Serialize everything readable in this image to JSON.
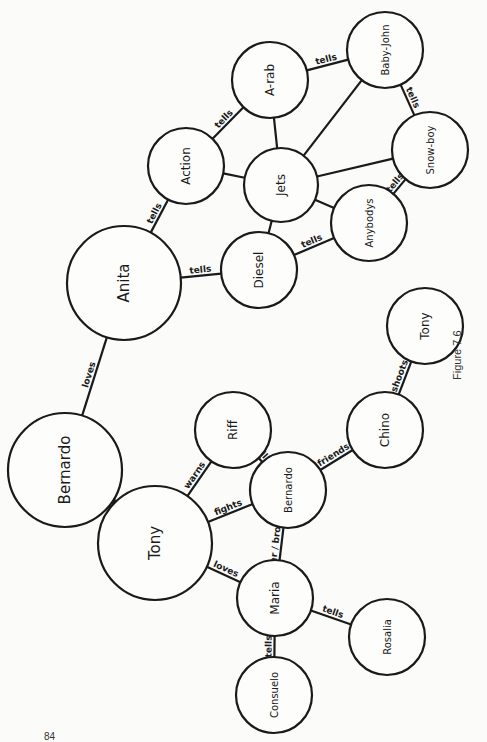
{
  "figure": {
    "caption": "Figure 7.6",
    "page_number": "84"
  },
  "nodes": [
    {
      "id": "baby-john",
      "label": "Baby-John",
      "x": 385,
      "y": 50,
      "r": 38
    },
    {
      "id": "a-rab",
      "label": "A-rab",
      "x": 270,
      "y": 80,
      "r": 38
    },
    {
      "id": "action",
      "label": "Action",
      "x": 186,
      "y": 166,
      "r": 38
    },
    {
      "id": "jets",
      "label": "Jets",
      "x": 281,
      "y": 185,
      "r": 37
    },
    {
      "id": "snow-boy",
      "label": "Snow-boy",
      "x": 430,
      "y": 150,
      "r": 38
    },
    {
      "id": "anybodys",
      "label": "Anybodys",
      "x": 369,
      "y": 223,
      "r": 38
    },
    {
      "id": "diesel",
      "label": "Diesel",
      "x": 259,
      "y": 270,
      "r": 38
    },
    {
      "id": "anita",
      "label": "Anita",
      "x": 124,
      "y": 283,
      "r": 57
    },
    {
      "id": "bernardo-1",
      "label": "Bernardo",
      "x": 65,
      "y": 470,
      "r": 57
    },
    {
      "id": "riff",
      "label": "Riff",
      "x": 233,
      "y": 430,
      "r": 38
    },
    {
      "id": "tony-1",
      "label": "Tony",
      "x": 155,
      "y": 543,
      "r": 57
    },
    {
      "id": "bernardo-2",
      "label": "Bernardo",
      "x": 288,
      "y": 490,
      "r": 38
    },
    {
      "id": "chino",
      "label": "Chino",
      "x": 385,
      "y": 430,
      "r": 38
    },
    {
      "id": "tony-2",
      "label": "Tony",
      "x": 425,
      "y": 326,
      "r": 38
    },
    {
      "id": "maria",
      "label": "Maria",
      "x": 275,
      "y": 598,
      "r": 38
    },
    {
      "id": "consuelo",
      "label": "Consuelo",
      "x": 274,
      "y": 695,
      "r": 38
    },
    {
      "id": "rosalia",
      "label": "Rosalia",
      "x": 387,
      "y": 637,
      "r": 38
    }
  ],
  "edges": [
    {
      "from": "a-rab",
      "to": "baby-john",
      "label": "tells"
    },
    {
      "from": "action",
      "to": "a-rab",
      "label": "tells"
    },
    {
      "from": "baby-john",
      "to": "snow-boy",
      "label": "tells"
    },
    {
      "from": "jets",
      "to": "a-rab",
      "label": ""
    },
    {
      "from": "jets",
      "to": "baby-john",
      "label": ""
    },
    {
      "from": "jets",
      "to": "snow-boy",
      "label": ""
    },
    {
      "from": "jets",
      "to": "action",
      "label": ""
    },
    {
      "from": "jets",
      "to": "anybodys",
      "label": ""
    },
    {
      "from": "jets",
      "to": "diesel",
      "label": ""
    },
    {
      "from": "anybodys",
      "to": "snow-boy",
      "label": "tells"
    },
    {
      "from": "diesel",
      "to": "anybodys",
      "label": "tells"
    },
    {
      "from": "anita",
      "to": "action",
      "label": "tells"
    },
    {
      "from": "anita",
      "to": "diesel",
      "label": "tells"
    },
    {
      "from": "bernardo-1",
      "to": "anita",
      "label": "loves"
    },
    {
      "from": "tony-1",
      "to": "bernardo-1",
      "label": "hates"
    },
    {
      "from": "tony-1",
      "to": "riff",
      "label": "warns"
    },
    {
      "from": "tony-1",
      "to": "bernardo-2",
      "label": "fights"
    },
    {
      "from": "bernardo-2",
      "to": "riff",
      "label": "kills"
    },
    {
      "from": "bernardo-2",
      "to": "chino",
      "label": "friends"
    },
    {
      "from": "chino",
      "to": "tony-2",
      "label": "shoots"
    },
    {
      "from": "maria",
      "to": "bernardo-2",
      "label": "sister / brother"
    },
    {
      "from": "maria",
      "to": "tony-1",
      "label": "loves"
    },
    {
      "from": "maria",
      "to": "rosalia",
      "label": "tells"
    },
    {
      "from": "maria",
      "to": "consuelo",
      "label": "tells"
    }
  ]
}
